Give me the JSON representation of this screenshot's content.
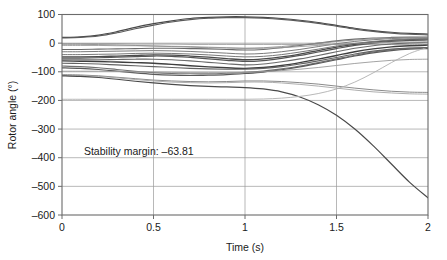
{
  "chart_data": {
    "type": "line",
    "title": "",
    "xlabel": "Time (s)",
    "ylabel": "Rotor angle (°)",
    "xlim": [
      0,
      2
    ],
    "ylim": [
      -600,
      100
    ],
    "xticks": [
      "0",
      "0.5",
      "1",
      "1.5",
      "2"
    ],
    "xtick_values": [
      0,
      0.5,
      1,
      1.5,
      2
    ],
    "yticks": [
      "100",
      "0",
      "-100",
      "-200",
      "-300",
      "-400",
      "-500",
      "-600"
    ],
    "ytick_values": [
      100,
      0,
      -100,
      -200,
      -300,
      -400,
      -500,
      -600
    ],
    "grid": true,
    "legend": "none",
    "annotations": [
      {
        "name": "stability-margin-annotation",
        "text": "Stability margin: –63.81",
        "x": 0.12,
        "y": -390
      }
    ],
    "x": [
      0,
      0.1,
      0.2,
      0.3,
      0.4,
      0.5,
      0.6,
      0.7,
      0.8,
      0.9,
      1.0,
      1.1,
      1.2,
      1.3,
      1.4,
      1.5,
      1.6,
      1.7,
      1.8,
      1.9,
      2.0
    ],
    "series": [
      {
        "name": "gen-1",
        "color": "#4a4a4a",
        "width": 1.2,
        "values": [
          20,
          22,
          28,
          40,
          55,
          68,
          78,
          86,
          90,
          92,
          92,
          90,
          86,
          80,
          72,
          62,
          52,
          44,
          38,
          34,
          32
        ]
      },
      {
        "name": "gen-2",
        "color": "#5a5a5a",
        "width": 1.1,
        "values": [
          18,
          20,
          25,
          36,
          50,
          63,
          74,
          82,
          87,
          89,
          89,
          87,
          83,
          77,
          69,
          59,
          49,
          41,
          35,
          31,
          29
        ]
      },
      {
        "name": "gen-3",
        "color": "#8c8c8c",
        "width": 0.9,
        "values": [
          -2,
          -2,
          -2,
          -2,
          -3,
          -3,
          -3,
          -4,
          -4,
          -4,
          -4,
          -4,
          -4,
          -4,
          -4,
          -4,
          -4,
          -4,
          -4,
          -4,
          -4
        ]
      },
      {
        "name": "gen-4",
        "color": "#6a6a6a",
        "width": 1.1,
        "values": [
          -22,
          -22,
          -21,
          -20,
          -19,
          -18,
          -18,
          -19,
          -20,
          -22,
          -24,
          -22,
          -16,
          -8,
          0,
          8,
          14,
          18,
          20,
          21,
          21
        ]
      },
      {
        "name": "gen-5",
        "color": "#7a7a7a",
        "width": 1.0,
        "values": [
          -30,
          -30,
          -29,
          -28,
          -27,
          -26,
          -27,
          -29,
          -32,
          -35,
          -38,
          -36,
          -30,
          -22,
          -12,
          -2,
          6,
          12,
          16,
          18,
          18
        ]
      },
      {
        "name": "gen-6",
        "color": "#4a4a4a",
        "width": 1.3,
        "values": [
          -48,
          -48,
          -47,
          -45,
          -43,
          -41,
          -42,
          -45,
          -49,
          -54,
          -58,
          -55,
          -48,
          -38,
          -26,
          -14,
          -4,
          4,
          10,
          13,
          14
        ]
      },
      {
        "name": "gen-7",
        "color": "#555555",
        "width": 1.2,
        "values": [
          -52,
          -52,
          -51,
          -49,
          -47,
          -45,
          -46,
          -50,
          -55,
          -60,
          -64,
          -61,
          -53,
          -43,
          -31,
          -19,
          -8,
          0,
          6,
          10,
          11
        ]
      },
      {
        "name": "gen-8",
        "color": "#6a6a6a",
        "width": 1.1,
        "values": [
          -58,
          -58,
          -58,
          -57,
          -56,
          -56,
          -58,
          -62,
          -67,
          -72,
          -76,
          -73,
          -65,
          -55,
          -43,
          -30,
          -18,
          -9,
          -3,
          1,
          3
        ]
      },
      {
        "name": "gen-9",
        "color": "#3f3f3f",
        "width": 1.4,
        "values": [
          -62,
          -63,
          -64,
          -66,
          -68,
          -70,
          -74,
          -79,
          -83,
          -86,
          -88,
          -85,
          -78,
          -68,
          -56,
          -43,
          -30,
          -20,
          -13,
          -9,
          -7
        ]
      },
      {
        "name": "gen-10",
        "color": "#707070",
        "width": 1.1,
        "values": [
          -80,
          -82,
          -86,
          -92,
          -98,
          -103,
          -106,
          -107,
          -107,
          -105,
          -102,
          -97,
          -90,
          -80,
          -68,
          -55,
          -42,
          -31,
          -23,
          -18,
          -16
        ]
      },
      {
        "name": "gen-11",
        "color": "#5a5a5a",
        "width": 1.2,
        "values": [
          -86,
          -88,
          -92,
          -98,
          -104,
          -109,
          -112,
          -113,
          -112,
          -110,
          -106,
          -101,
          -93,
          -83,
          -71,
          -58,
          -45,
          -34,
          -26,
          -21,
          -19
        ]
      },
      {
        "name": "gen-12",
        "color": "#9a9a9a",
        "width": 0.9,
        "values": [
          -98,
          -98,
          -98,
          -99,
          -100,
          -101,
          -102,
          -103,
          -103,
          -103,
          -102,
          -100,
          -96,
          -91,
          -85,
          -78,
          -71,
          -65,
          -60,
          -57,
          -56
        ]
      },
      {
        "name": "gen-13",
        "color": "#8a8a8a",
        "width": 1.0,
        "values": [
          -110,
          -111,
          -114,
          -119,
          -124,
          -129,
          -132,
          -134,
          -135,
          -134,
          -132,
          -132,
          -134,
          -138,
          -143,
          -150,
          -157,
          -163,
          -168,
          -171,
          -172
        ]
      },
      {
        "name": "gen-14",
        "color": "#a5a5a5",
        "width": 0.9,
        "values": [
          -112,
          -113,
          -116,
          -121,
          -127,
          -132,
          -136,
          -138,
          -139,
          -138,
          -136,
          -136,
          -139,
          -144,
          -150,
          -157,
          -164,
          -170,
          -174,
          -177,
          -178
        ]
      },
      {
        "name": "gen-15-unstable",
        "color": "#4a4a4a",
        "width": 1.2,
        "values": [
          -114,
          -116,
          -120,
          -126,
          -133,
          -139,
          -144,
          -148,
          -151,
          -153,
          -155,
          -160,
          -170,
          -188,
          -215,
          -252,
          -300,
          -358,
          -422,
          -486,
          -540
        ]
      },
      {
        "name": "gen-16",
        "color": "#b0b0b0",
        "width": 0.9,
        "values": [
          -196,
          -196,
          -196,
          -196,
          -196,
          -196,
          -196,
          -196,
          -196,
          -196,
          -196,
          -195,
          -192,
          -186,
          -176,
          -160,
          -136,
          -104,
          -68,
          -36,
          -14
        ]
      },
      {
        "name": "gen-17",
        "color": "#9a9a9a",
        "width": 0.9,
        "values": [
          -8,
          -8,
          -8,
          -9,
          -9,
          -10,
          -11,
          -12,
          -14,
          -16,
          -18,
          -18,
          -16,
          -12,
          -8,
          -4,
          -1,
          1,
          3,
          4,
          4
        ]
      },
      {
        "name": "gen-18",
        "color": "#787878",
        "width": 1.0,
        "values": [
          -40,
          -40,
          -39,
          -38,
          -36,
          -35,
          -36,
          -38,
          -41,
          -45,
          -48,
          -46,
          -40,
          -31,
          -21,
          -10,
          -1,
          6,
          11,
          14,
          15
        ]
      },
      {
        "name": "gen-19",
        "color": "#636363",
        "width": 1.1,
        "values": [
          -70,
          -71,
          -73,
          -76,
          -79,
          -82,
          -85,
          -88,
          -90,
          -91,
          -91,
          -88,
          -82,
          -73,
          -62,
          -50,
          -38,
          -28,
          -21,
          -17,
          -15
        ]
      },
      {
        "name": "gen-20",
        "color": "#8f8f8f",
        "width": 0.9,
        "values": [
          -4,
          -4,
          -5,
          -6,
          -8,
          -10,
          -12,
          -14,
          -16,
          -17,
          -18,
          -16,
          -12,
          -6,
          0,
          6,
          11,
          15,
          18,
          19,
          20
        ]
      }
    ]
  }
}
